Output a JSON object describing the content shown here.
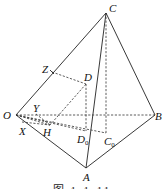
{
  "figure": {
    "type": "tetrahedron-projection-diagram",
    "caption": "图 1-1-11",
    "points": {
      "C": {
        "label": "C",
        "x": 106,
        "y": 13
      },
      "O": {
        "label": "O",
        "x": 16,
        "y": 115
      },
      "B": {
        "label": "B",
        "x": 155,
        "y": 115
      },
      "A": {
        "label": "A",
        "x": 86,
        "y": 168
      },
      "Z": {
        "label": "Z",
        "x": 52,
        "y": 72
      },
      "D": {
        "label": "D",
        "x": 86,
        "y": 84
      },
      "H": {
        "label": "H",
        "x": 50,
        "y": 125
      },
      "Y": {
        "label": "Y",
        "x": 36,
        "y": 111
      },
      "X": {
        "label": "X",
        "x": 24,
        "y": 128
      },
      "D0": {
        "label": "D",
        "sub": "0",
        "x": 87,
        "y": 133
      },
      "C0": {
        "label": "C",
        "sub": "0",
        "x": 106,
        "y": 136
      }
    },
    "solid_edges": [
      "O-C",
      "C-B",
      "C-A",
      "O-A",
      "A-B"
    ],
    "dashed_edges": [
      "O-B",
      "C-C0",
      "D-D0",
      "Z-D",
      "D-H",
      "O-C0",
      "O-D0",
      "O-H",
      "Y-H",
      "X-H"
    ]
  }
}
